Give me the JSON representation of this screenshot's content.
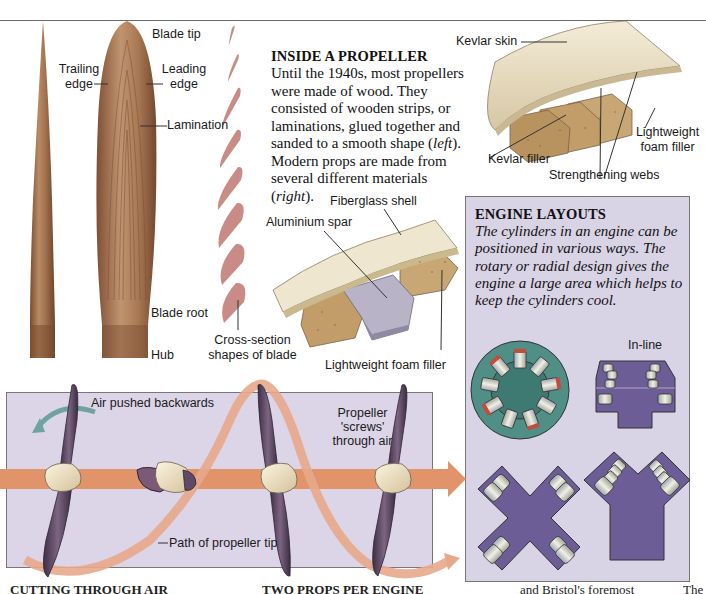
{
  "inside_propeller": {
    "title": "INSIDE A PROPELLER",
    "body_parts": [
      "Until the 1940s, most propellers were made of wood. They consisted of wooden strips, or laminations, glued together and sanded to a smooth shape (",
      "left",
      "). Modern props are made from several different materials (",
      "right",
      ")."
    ]
  },
  "wooden_blade_labels": {
    "blade_tip": "Blade tip",
    "trailing_edge": "Trailing edge",
    "leading_edge": "Leading edge",
    "lamination": "Lamination",
    "blade_root": "Blade root",
    "hub": "Hub",
    "cross_section": "Cross-section shapes of blade"
  },
  "kevlar_blade_labels": {
    "kevlar_skin": "Kevlar skin",
    "kevlar_filler": "Kevlar filler",
    "lightweight_foam_filler": "Lightweight foam filler",
    "strengthening_webs": "Strengthening webs"
  },
  "fiberglass_blade_labels": {
    "fiberglass_shell": "Fiberglass shell",
    "aluminium_spar": "Aluminium spar",
    "lightweight_foam_filler": "Lightweight foam filler"
  },
  "engine_layouts": {
    "title": "ENGINE LAYOUTS",
    "body": "The cylinders in an engine can be positioned in various ways. The rotary or radial design gives the engine a large area which helps to keep the cylinders cool.",
    "in_line_label": "In-line",
    "diagrams": [
      "rotary-radial",
      "in-line",
      "x-layout",
      "v-layout"
    ]
  },
  "air_diagram": {
    "air_pushed_backwards": "Air pushed backwards",
    "propeller_screws": "Propeller 'screws' through air",
    "path_of_tip": "Path of propeller tip"
  },
  "bottom_headings": {
    "cutting_through_air": "CUTTING THROUGH AIR",
    "two_props_per_engine": "TWO PROPS PER ENGINE",
    "fragment_right": "and Bristol's foremost",
    "fragment_far_right": "The"
  },
  "colors": {
    "wood_dark": "#8a5a3c",
    "wood_light": "#b98a64",
    "section_pink": "#c98b86",
    "kevlar_skin": "#e8dcc0",
    "foam": "#c9a775",
    "panel_lavender": "#dcd5e8",
    "arrow_orange": "#e1946a",
    "rotary_teal": "#4f8f86",
    "engine_purple": "#6c5d96",
    "prop_dark": "#5e4a66",
    "spinner": "#f1e6c6"
  }
}
